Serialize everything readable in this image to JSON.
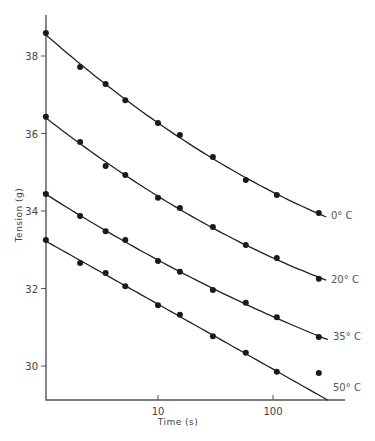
{
  "chart_data": {
    "type": "line",
    "title": "",
    "xlabel": "Time (s)",
    "ylabel": "Tension (g)",
    "x_scale": "log",
    "xlim": [
      1,
      300
    ],
    "ylim": [
      29.2,
      39.1
    ],
    "x_ticks": [
      {
        "value": 10,
        "label": "10"
      },
      {
        "value": 100,
        "label": "100"
      }
    ],
    "y_ticks": [
      {
        "value": 30,
        "label": "30"
      },
      {
        "value": 32,
        "label": "32"
      },
      {
        "value": 34,
        "label": "34"
      },
      {
        "value": 36,
        "label": "36"
      },
      {
        "value": 38,
        "label": "38"
      }
    ],
    "grid": false,
    "legend": "inline labels at right end of each curve",
    "x": [
      1.06,
      2.1,
      3.5,
      5.2,
      10,
      15.5,
      30,
      58,
      108,
      250
    ],
    "series": [
      {
        "name": "0° C",
        "label": "0° C",
        "values": [
          38.59,
          37.72,
          37.28,
          36.86,
          36.27,
          35.96,
          35.39,
          34.8,
          34.41,
          33.95
        ]
      },
      {
        "name": "20° C",
        "label": "20° C",
        "values": [
          36.43,
          35.78,
          35.16,
          34.93,
          34.34,
          34.08,
          33.59,
          33.12,
          32.79,
          32.25
        ]
      },
      {
        "name": "35° C",
        "label": "35° C",
        "values": [
          34.44,
          33.87,
          33.48,
          33.25,
          32.71,
          32.43,
          31.96,
          31.63,
          31.26,
          30.75
        ]
      },
      {
        "name": "50° C",
        "label": "50° C",
        "values": [
          33.25,
          32.66,
          32.4,
          32.06,
          31.57,
          31.32,
          30.77,
          30.34,
          29.85,
          29.82
        ]
      }
    ],
    "fit_curves": [
      {
        "name": "0° C",
        "end_x": 290,
        "end_y": 33.8
      },
      {
        "name": "20° C",
        "end_x": 290,
        "end_y": 32.1
      },
      {
        "name": "35° C",
        "end_x": 300,
        "end_y": 30.6
      },
      {
        "name": "50° C",
        "end_x": 300,
        "end_y": 29.35
      }
    ]
  },
  "labels": {
    "xlabel": "Time (s)",
    "ylabel": "Tension (g)"
  }
}
